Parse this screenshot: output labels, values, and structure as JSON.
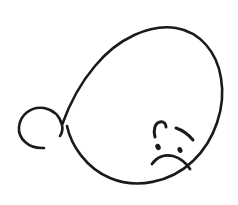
{
  "artwork": {
    "title": "Sad face line drawing",
    "description": "Single continuous calligraphic stroke forming a large oval head with a decorative spiral flourish at the lower left, containing a sad face",
    "canvas": {
      "width": 238,
      "height": 205,
      "background_color": "#ffffff"
    },
    "ink_color": "#1a1a1a",
    "strokes": {
      "head_and_flourish": {
        "name": "head-and-flourish-stroke",
        "stroke_width": 2.6,
        "path": "M 44 148 C 28 149 18 138 19 127 C 20 115 31 106 44 108 C 54 110 60 117 62 125 C 63 129 62 133 60 136 M 62 125 C 68 108 78 86 95 66 C 118 38 150 24 176 28 C 200 32 217 52 221 78 C 226 107 215 140 193 161 C 170 183 136 189 110 178 C 86 168 71 145 67 126"
      },
      "eyebrow_left": {
        "name": "left-eyebrow-stroke",
        "stroke_width": 3.0,
        "path": "M 155 137 C 153 130 155 123 160 122 C 164 121 166 124 166 127"
      },
      "eyebrow_right": {
        "name": "right-eyebrow-stroke",
        "stroke_width": 3.0,
        "path": "M 176 128 C 182 130 188 134 193 140"
      },
      "eye_left": {
        "name": "left-eye-dot",
        "cx": 158,
        "cy": 147,
        "rx": 2.6,
        "ry": 3.2,
        "rotation": -25
      },
      "eye_right": {
        "name": "right-eye-dot",
        "cx": 180,
        "cy": 150,
        "rx": 2.4,
        "ry": 3.0,
        "rotation": -25
      },
      "mouth": {
        "name": "frowning-mouth-stroke",
        "stroke_width": 2.8,
        "path": "M 152 164 C 157 157 165 154 173 156 C 180 158 186 163 190 169"
      }
    }
  }
}
